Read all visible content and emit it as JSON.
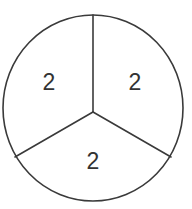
{
  "diagram": {
    "type": "circle-divided-into-three-equal-sectors",
    "sectors": [
      {
        "id": "upper-left",
        "label": "2"
      },
      {
        "id": "upper-right",
        "label": "2"
      },
      {
        "id": "bottom",
        "label": "2"
      }
    ],
    "colors": {
      "stroke": "#3a3a3a",
      "text": "#333333",
      "fill": "#ffffff"
    }
  }
}
